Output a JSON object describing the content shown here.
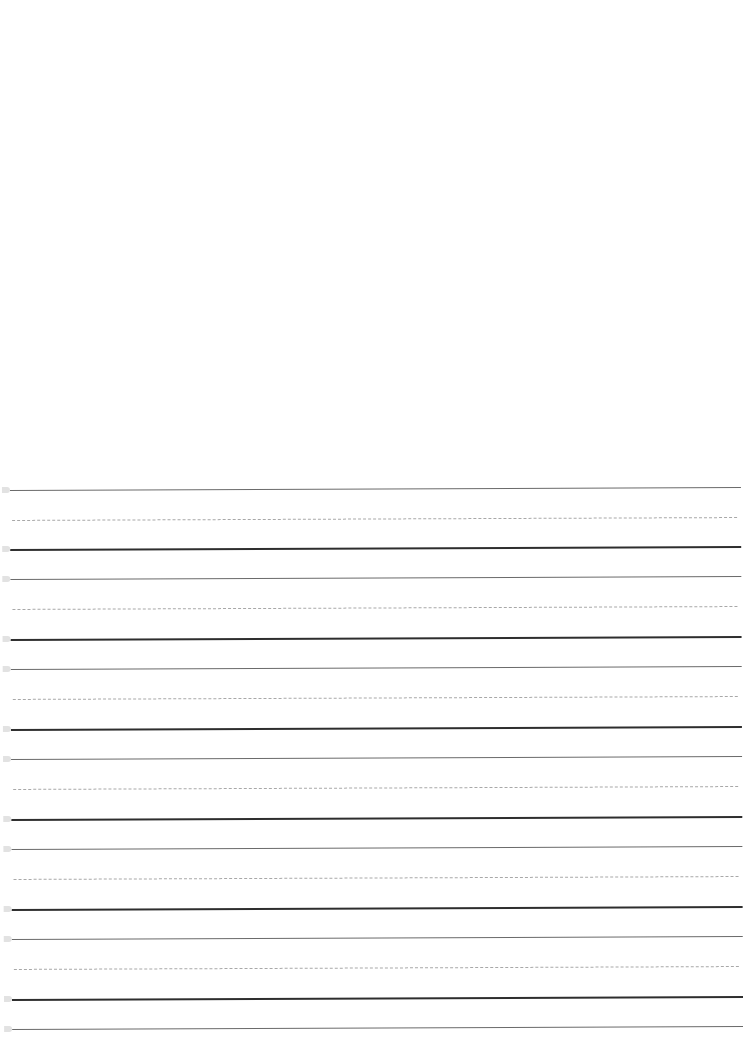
{
  "document": {
    "type": "handwriting practice sheet",
    "blank_area": {
      "top": 0,
      "height": 470
    },
    "colors": {
      "background": "#ffffff",
      "top_line": "#6a6a6a",
      "mid_line": "#a8a8a8",
      "base_line": "#2e2e2e"
    },
    "line_spacing_px": 30,
    "rows": [
      {
        "top_y": 490,
        "mid_y": 520,
        "base_y": 549
      },
      {
        "top_y": 579,
        "mid_y": 609,
        "base_y": 639
      },
      {
        "top_y": 669,
        "mid_y": 699,
        "base_y": 729
      },
      {
        "top_y": 759,
        "mid_y": 789,
        "base_y": 819
      },
      {
        "top_y": 849,
        "mid_y": 879,
        "base_y": 909
      },
      {
        "top_y": 939,
        "mid_y": 969,
        "base_y": 999
      }
    ],
    "final_top_line_y": 1029
  }
}
